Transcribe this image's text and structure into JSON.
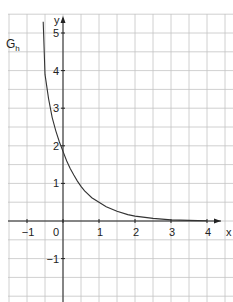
{
  "chart_data": {
    "type": "line",
    "title": "",
    "curve_label": "G",
    "curve_label_sub": "h",
    "xlabel": "x",
    "ylabel": "y",
    "xlim": [
      -1.5,
      4.5
    ],
    "ylim": [
      -2,
      5.5
    ],
    "grid": true,
    "grid_step": 0.5,
    "x_ticks": [
      {
        "v": -1,
        "label": "−1"
      },
      {
        "v": 0,
        "label": "0"
      },
      {
        "v": 1,
        "label": "1"
      },
      {
        "v": 2,
        "label": "2"
      },
      {
        "v": 3,
        "label": "3"
      },
      {
        "v": 4,
        "label": "4"
      }
    ],
    "y_ticks": [
      {
        "v": -1,
        "label": "−1"
      },
      {
        "v": 1,
        "label": "1"
      },
      {
        "v": 2,
        "label": "2"
      },
      {
        "v": 3,
        "label": "3"
      },
      {
        "v": 4,
        "label": "4"
      },
      {
        "v": 5,
        "label": "5"
      }
    ],
    "series": [
      {
        "name": "G_h",
        "x": [
          -0.55,
          -0.5,
          -0.4,
          -0.3,
          -0.2,
          -0.1,
          0,
          0.1,
          0.2,
          0.3,
          0.4,
          0.5,
          0.6,
          0.8,
          1.0,
          1.2,
          1.5,
          1.8,
          2.0,
          2.5,
          3.0,
          3.5,
          4.0
        ],
        "y": [
          5.3,
          3.9,
          3.25,
          2.75,
          2.4,
          2.1,
          1.85,
          1.6,
          1.4,
          1.22,
          1.06,
          0.92,
          0.8,
          0.62,
          0.5,
          0.38,
          0.26,
          0.17,
          0.13,
          0.07,
          0.03,
          0.015,
          0.005
        ]
      }
    ]
  }
}
